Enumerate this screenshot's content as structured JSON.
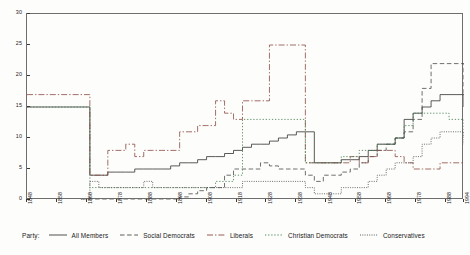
{
  "chart_data": {
    "type": "line",
    "title": "",
    "xlabel": "",
    "ylabel": "",
    "xlim": [
      1848,
      1994
    ],
    "ylim": [
      0,
      30
    ],
    "yticks": [
      0,
      5,
      10,
      15,
      20,
      25,
      30
    ],
    "xticks": [
      1848,
      1858,
      1868,
      1878,
      1888,
      1898,
      1908,
      1918,
      1928,
      1938,
      1948,
      1958,
      1968,
      1978,
      1988,
      1994
    ],
    "xticklabels": [
      "1848",
      "1858",
      "1868",
      "1878",
      "1888",
      "1898",
      "1908",
      "1918",
      "1928",
      "1938",
      "1948",
      "1958",
      "1968",
      "1978",
      "1988",
      "1994"
    ],
    "grid": false,
    "drawstyle": "steps-post",
    "legend_position": "below-axes",
    "legend_title": "Party:",
    "series": [
      {
        "name": "All Members",
        "linestyle": "solid",
        "color": "#3d3d3d",
        "x": [
          1848,
          1866,
          1869,
          1872,
          1875,
          1878,
          1881,
          1884,
          1887,
          1890,
          1893,
          1896,
          1899,
          1902,
          1905,
          1908,
          1911,
          1914,
          1917,
          1920,
          1923,
          1926,
          1929,
          1932,
          1935,
          1938,
          1941,
          1944,
          1947,
          1950,
          1953,
          1956,
          1959,
          1962,
          1965,
          1968,
          1971,
          1974,
          1977,
          1980,
          1983,
          1986,
          1989,
          1994
        ],
        "values": [
          15,
          15,
          4,
          4,
          4.5,
          4.5,
          4.5,
          5,
          5,
          5,
          5,
          5.5,
          6,
          6,
          6.5,
          7,
          7,
          7.5,
          8,
          8.5,
          9,
          9,
          9.5,
          10,
          10.5,
          11,
          11,
          6,
          6,
          6,
          6.5,
          6.5,
          7,
          8,
          9,
          9,
          10,
          13,
          14,
          15,
          16,
          17,
          17,
          15
        ]
      },
      {
        "name": "Social Democrats",
        "linestyle": "dashed",
        "color": "#4a4a4a",
        "x": [
          1866,
          1869,
          1872,
          1875,
          1878,
          1881,
          1884,
          1887,
          1890,
          1893,
          1896,
          1899,
          1902,
          1905,
          1908,
          1911,
          1914,
          1917,
          1920,
          1923,
          1926,
          1929,
          1932,
          1935,
          1938,
          1941,
          1944,
          1947,
          1950,
          1953,
          1956,
          1959,
          1962,
          1965,
          1968,
          1971,
          1974,
          1977,
          1980,
          1983,
          1986,
          1989,
          1994
        ],
        "values": [
          0,
          0,
          0,
          0,
          0,
          0,
          0,
          0,
          0,
          0,
          0,
          0.5,
          1,
          1.5,
          2,
          2,
          4,
          5,
          5,
          5,
          6,
          5.5,
          5,
          5,
          5,
          4,
          3,
          4,
          4,
          4.5,
          5,
          6,
          7,
          8,
          9,
          10,
          11,
          13,
          18,
          22,
          22,
          22,
          17
        ]
      },
      {
        "name": "Liberals",
        "linestyle": "dashdot",
        "color": "#8c4a42",
        "x": [
          1848,
          1866,
          1869,
          1872,
          1875,
          1878,
          1881,
          1884,
          1887,
          1890,
          1893,
          1896,
          1899,
          1902,
          1905,
          1908,
          1911,
          1914,
          1917,
          1920,
          1923,
          1926,
          1929,
          1932,
          1935,
          1938,
          1941,
          1944,
          1947,
          1950,
          1953,
          1956,
          1959,
          1962,
          1965,
          1968,
          1971,
          1974,
          1977,
          1980,
          1983,
          1986,
          1989,
          1994
        ],
        "values": [
          17,
          17,
          4,
          4,
          8,
          8,
          9,
          7,
          8,
          8,
          8,
          8,
          11,
          11,
          12,
          12,
          16,
          14,
          13,
          16,
          16,
          16,
          25,
          25,
          25,
          25,
          6,
          6,
          6,
          6,
          6,
          7,
          6,
          7,
          8,
          8,
          7,
          6,
          5,
          5,
          5,
          6,
          6,
          6
        ]
      },
      {
        "name": "Christian Democrats",
        "linestyle": "dotted",
        "color": "#3f7a4a",
        "x": [
          1848,
          1866,
          1869,
          1872,
          1875,
          1878,
          1881,
          1884,
          1887,
          1890,
          1893,
          1896,
          1899,
          1902,
          1905,
          1908,
          1911,
          1914,
          1917,
          1920,
          1923,
          1926,
          1929,
          1932,
          1935,
          1938,
          1941,
          1944,
          1947,
          1950,
          1953,
          1956,
          1959,
          1962,
          1965,
          1968,
          1971,
          1974,
          1977,
          1980,
          1983,
          1986,
          1989,
          1994
        ],
        "values": [
          15,
          15,
          2,
          2,
          2,
          2,
          2,
          2,
          2,
          2,
          2,
          2,
          2,
          2,
          2,
          2,
          3,
          3,
          4,
          13,
          13,
          13,
          13,
          13,
          13,
          13,
          6,
          6,
          6,
          6,
          7,
          7,
          8,
          8,
          9,
          9,
          10,
          12,
          14,
          14,
          14,
          14,
          13,
          10
        ]
      },
      {
        "name": "Conservatives",
        "linestyle": "densely-dotted",
        "color": "#4a4a4a",
        "x": [
          1866,
          1869,
          1872,
          1875,
          1878,
          1881,
          1884,
          1887,
          1890,
          1893,
          1896,
          1899,
          1902,
          1905,
          1908,
          1911,
          1914,
          1917,
          1920,
          1923,
          1926,
          1929,
          1932,
          1935,
          1938,
          1941,
          1944,
          1947,
          1950,
          1953,
          1956,
          1959,
          1962,
          1965,
          1968,
          1971,
          1974,
          1977,
          1980,
          1983,
          1986,
          1989,
          1994
        ],
        "values": [
          0,
          3,
          2,
          2,
          2,
          2,
          2,
          3,
          2,
          2,
          2,
          2,
          2,
          2,
          2,
          2,
          2,
          2,
          3,
          3,
          3,
          3,
          3,
          3,
          3,
          2,
          1,
          1,
          1,
          2,
          2,
          2,
          3,
          4,
          5,
          6,
          6,
          7,
          9,
          10,
          11,
          11,
          9
        ]
      }
    ]
  },
  "legend": {
    "title": "Party:",
    "items": [
      {
        "label": "All Members"
      },
      {
        "label": "Social Democrats"
      },
      {
        "label": "Liberals"
      },
      {
        "label": "Christian Democrats"
      },
      {
        "label": "Conservatives"
      }
    ]
  },
  "colors": {
    "axis": "#6e6e6e",
    "all_members": "#3d3d3d",
    "social_democrats": "#4a4a4a",
    "liberals": "#8c4a42",
    "christian_democrats": "#3f7a4a",
    "conservatives": "#4a4a4a",
    "background": "#fdfdfb"
  }
}
